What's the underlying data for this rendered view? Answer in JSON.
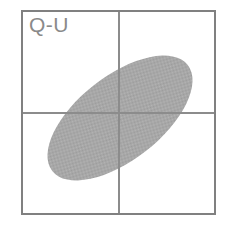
{
  "panel": {
    "label": "Q-U",
    "label_color": "#8a8a8a",
    "label_font_size": 21,
    "background_color": "#ffffff"
  },
  "frame": {
    "x": 22,
    "y": 11,
    "width": 193,
    "height": 203,
    "stroke_color": "#808080",
    "stroke_width": 2
  },
  "axes": {
    "vertical_x": 119,
    "horizontal_y": 113,
    "stroke_color": "#8c8c8c",
    "stroke_width": 1.2
  },
  "chart_data": {
    "type": "scatter",
    "title": "Q-U",
    "xlabel": "Q",
    "ylabel": "U",
    "grid": false,
    "legend": "none",
    "annotations": [
      "Q-U"
    ],
    "origin_lines": {
      "x": 0,
      "y": 0
    },
    "xlim": [
      -1,
      1
    ],
    "ylim": [
      -1,
      1
    ],
    "series": [
      {
        "name": "Q-U joint confidence region",
        "shape": "ellipse",
        "fill_color": "#a8a8a8",
        "fill_style": "dithered-halftone",
        "center_x": 0.0,
        "center_y": 0.05,
        "center_px": [
          120,
          118
        ],
        "semi_major_px": 86,
        "semi_minor_px": 42,
        "rotation_deg": -38,
        "correlation_sign": "positive"
      }
    ]
  }
}
